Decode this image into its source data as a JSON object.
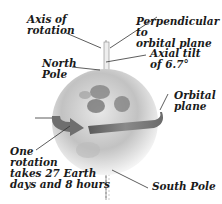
{
  "diagram": {
    "labels": {
      "axis_of_rotation": "Axis of\nrotation",
      "north_pole": "North\nPole",
      "perpendicular": "Perpendicular to\norbital plane",
      "axial_tilt": "Axial tilt\nof 6.7°",
      "orbital_plane": "Orbital\nplane",
      "one_rotation": "One\nrotation\ntakes 27 Earth\ndays and 8 hours",
      "south_pole": "South Pole"
    },
    "colors": {
      "globe_light": "#e6e6e6",
      "globe_mid": "#b4b4b4",
      "globe_dark": "#6e6e6e",
      "arrow": "#7a7a7a",
      "arrow_dark": "#5a5a5a",
      "leader_line": "#333333",
      "text": "#1a1a1a"
    }
  }
}
